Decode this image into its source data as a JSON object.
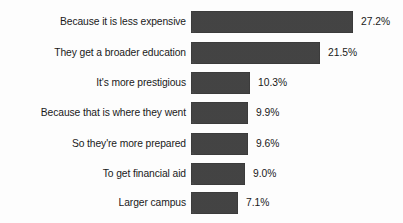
{
  "chart_data": {
    "type": "bar",
    "orientation": "horizontal",
    "title": "",
    "subtitle": "",
    "xlabel": "",
    "ylabel": "",
    "legend": [],
    "legend_position": "none",
    "grid": false,
    "axis_visible": false,
    "value_label_suffix": "%",
    "xlim": [
      0,
      27.2
    ],
    "categories": [
      "Because it is less expensive",
      "They get a broader education",
      "It's more prestigious",
      "Because that is where they went",
      "So they're more prepared",
      "To get financial aid",
      "Larger campus"
    ],
    "values": [
      27.2,
      21.5,
      10.3,
      9.9,
      9.6,
      9.0,
      7.1
    ],
    "value_labels": [
      "27.2%",
      "21.5%",
      "10.3%",
      "9.9%",
      "9.6%",
      "9.0%",
      "7.1%"
    ],
    "bar_pixel_widths": [
      162,
      129,
      59,
      57,
      57,
      54,
      47
    ],
    "bar_color": "#474747",
    "background_color": "#fdfdfd",
    "text_color": "#1a1a1a"
  },
  "rows": [
    {
      "label": "Because it is less expensive",
      "value_label": "27.2%",
      "width_px": 162,
      "top_px": 11
    },
    {
      "label": "They get a broader education",
      "value_label": "21.5%",
      "width_px": 129,
      "top_px": 42
    },
    {
      "label": "It's more prestigious",
      "value_label": "10.3%",
      "width_px": 59,
      "top_px": 72
    },
    {
      "label": "Because that is where they went",
      "value_label": "9.9%",
      "width_px": 57,
      "top_px": 102
    },
    {
      "label": "So they're more prepared",
      "value_label": "9.6%",
      "width_px": 57,
      "top_px": 133
    },
    {
      "label": "To get financial aid",
      "value_label": "9.0%",
      "width_px": 54,
      "top_px": 163
    },
    {
      "label": "Larger campus",
      "value_label": "7.1%",
      "width_px": 47,
      "top_px": 192
    }
  ]
}
